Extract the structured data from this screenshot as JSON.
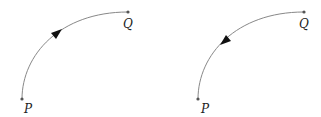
{
  "diagrams": [
    {
      "id": "left",
      "direction": "P-to-Q",
      "start_label": "P",
      "end_label": "Q"
    },
    {
      "id": "right",
      "direction": "Q-to-P",
      "start_label": "Q",
      "end_label": "P"
    }
  ],
  "labels": {
    "left_P": "P",
    "left_Q": "Q",
    "right_P": "P",
    "right_Q": "Q"
  },
  "colors": {
    "curve": "#888888",
    "point": "#555555",
    "arrow": "#111111"
  }
}
